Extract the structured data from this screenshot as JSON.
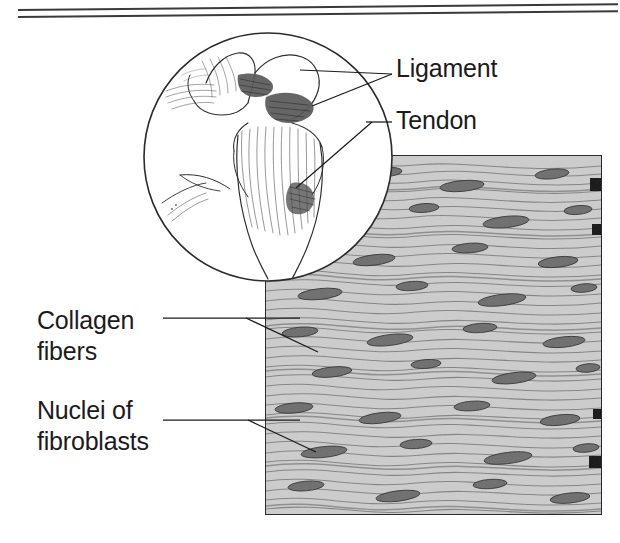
{
  "figure": {
    "caption": ""
  },
  "rules": {
    "top_label": "header-rule-upper",
    "bottom_label": "header-rule-lower"
  },
  "labels": {
    "ligament": "Ligament",
    "tendon": "Tendon",
    "collagen": "Collagen\nfibers",
    "nuclei": "Nuclei of\nfibroblasts"
  },
  "inset": {
    "name": "joint-circle-inset",
    "description": "Line drawing of a joint showing ligaments and tendon"
  },
  "micrograph": {
    "name": "collagen-fiber-micrograph",
    "description": "Wavy collagen fiber bundles with elongated fibroblast nuclei"
  },
  "colors": {
    "ink": "#1b1b1b",
    "rule": "#3a3a3a",
    "panel_border": "#2b2b2b",
    "panel_base": "#c9c9c9",
    "fiber_line": "#6e6e6e",
    "nucleus": "#6a6a6a",
    "nucleus_dark": "#3d3d3d"
  }
}
